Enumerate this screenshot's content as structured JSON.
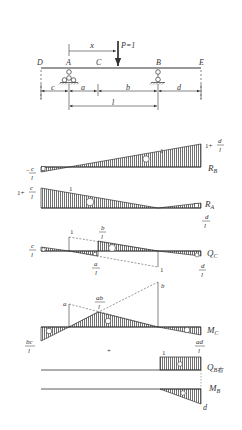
{
  "beam": {
    "points": {
      "D": "D",
      "A": "A",
      "C": "C",
      "B": "B",
      "E": "E"
    },
    "load_label": "P=1",
    "x_label": "x",
    "dims": {
      "c": "c",
      "a": "a",
      "b": "b",
      "d": "d",
      "l": "l"
    }
  },
  "influence_lines": {
    "RB": {
      "name": "R",
      "sub": "B",
      "left_value": {
        "num": "c",
        "den": "l",
        "sign": "−"
      },
      "right_value": {
        "prefix": "1+",
        "num": "d",
        "den": "l"
      },
      "mid_label": "1",
      "sign_main": "+",
      "sign_left": "−"
    },
    "RA": {
      "name": "R",
      "sub": "A",
      "left_value": {
        "prefix": "1+",
        "num": "c",
        "den": "l"
      },
      "right_value": {
        "num": "d",
        "den": "l"
      },
      "mid_label": "1",
      "sign_main": "+",
      "sign_right": "−"
    },
    "QC": {
      "name": "Q",
      "sub": "C",
      "left_value": {
        "num": "c",
        "den": "l"
      },
      "top_value": {
        "num": "b",
        "den": "l"
      },
      "bottom_value": {
        "num": "a",
        "den": "l"
      },
      "right_value": {
        "num": "d",
        "den": "l"
      },
      "dashed_top": "1",
      "dashed_bottom": "1"
    },
    "MC": {
      "name": "M",
      "sub": "C",
      "left_value": {
        "num": "bc",
        "den": "l"
      },
      "peak_value": {
        "num": "ab",
        "den": "l"
      },
      "right_value": {
        "num": "ad",
        "den": "l"
      },
      "dashed_a": "a",
      "dashed_b": "b"
    },
    "QBright": {
      "name": "Q",
      "sub": "B右",
      "value": "1"
    },
    "MB": {
      "name": "M",
      "sub": "B",
      "value": "d"
    }
  },
  "separator_mark": "+"
}
